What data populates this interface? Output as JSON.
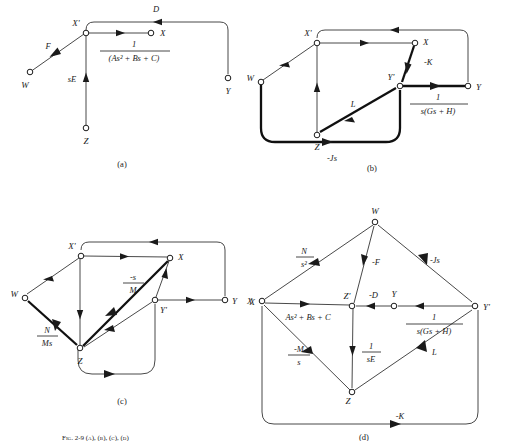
{
  "figure": {
    "caption": "Fig. 2-9 (a), (b), (c), (d)",
    "panels": [
      {
        "id": "a",
        "caption": "(a)",
        "nodes": [
          {
            "name": "W",
            "label": "W"
          },
          {
            "name": "Xp",
            "label": "X'"
          },
          {
            "name": "X",
            "label": "X"
          },
          {
            "name": "Y",
            "label": "Y"
          },
          {
            "name": "Z",
            "label": "Z"
          }
        ],
        "edges": [
          {
            "from": "W",
            "to": "Xp",
            "label": "F",
            "bold": false
          },
          {
            "from": "Z",
            "to": "Xp",
            "label": "sE",
            "bold": false
          },
          {
            "from": "Y",
            "to": "Xp",
            "label": "D",
            "bold": false
          },
          {
            "from": "Xp",
            "to": "X",
            "label": "1 / (As² + Bs + C)",
            "num": "1",
            "den": "(As²  +  Bs  +  C)",
            "bold": false
          }
        ]
      },
      {
        "id": "b",
        "caption": "(b)",
        "nodes": [
          {
            "name": "W",
            "label": "W"
          },
          {
            "name": "Xp",
            "label": "X'"
          },
          {
            "name": "X",
            "label": "X"
          },
          {
            "name": "Yp",
            "label": "Y'"
          },
          {
            "name": "Y",
            "label": "Y"
          },
          {
            "name": "Z",
            "label": "Z"
          }
        ],
        "edges": [
          {
            "from": "Xp",
            "to": "W",
            "label": "",
            "bold": false
          },
          {
            "from": "Z",
            "to": "Xp",
            "label": "",
            "bold": false
          },
          {
            "from": "Y",
            "to": "Xp",
            "label": "",
            "bold": false
          },
          {
            "from": "Xp",
            "to": "X",
            "label": "",
            "bold": false
          },
          {
            "from": "X",
            "to": "Yp",
            "label": "-K",
            "bold": true
          },
          {
            "from": "Z",
            "to": "Yp",
            "label": "L",
            "bold": true
          },
          {
            "from": "Yp",
            "to": "Y",
            "label": "1 / s(Gs + H)",
            "num": "1",
            "den": "s(Gs  +  H)",
            "bold": true
          },
          {
            "from": "W",
            "to": "Yp",
            "label": "-Js",
            "bold": true
          }
        ]
      },
      {
        "id": "c",
        "caption": "(c)",
        "nodes": [
          {
            "name": "W",
            "label": "W"
          },
          {
            "name": "Xp",
            "label": "X'"
          },
          {
            "name": "X",
            "label": "X"
          },
          {
            "name": "Yp",
            "label": "Y'"
          },
          {
            "name": "Y",
            "label": "Y"
          },
          {
            "name": "Z",
            "label": "Z"
          },
          {
            "name": "Xfar",
            "label": "X"
          }
        ],
        "edges": [
          {
            "from": "Xp",
            "to": "W",
            "label": "",
            "bold": false
          },
          {
            "from": "W",
            "to": "Z",
            "label": "N / Ms",
            "num": "N",
            "den": "Ms",
            "bold": true
          },
          {
            "from": "Z",
            "to": "Xp",
            "label": "",
            "bold": false
          },
          {
            "from": "Xp",
            "to": "X",
            "label": "",
            "bold": false
          },
          {
            "from": "X",
            "to": "Z",
            "label": "-s / M",
            "num": "-s",
            "den": "M",
            "bold": true
          },
          {
            "from": "Z",
            "to": "Yp",
            "label": "",
            "bold": false
          },
          {
            "from": "Yp",
            "to": "X",
            "label": "",
            "bold": false
          },
          {
            "from": "Yp",
            "to": "Y",
            "label": "",
            "bold": false
          },
          {
            "from": "Y",
            "to": "Xp",
            "label": "",
            "bold": false
          },
          {
            "from": "Z",
            "to": "Yp",
            "label": "",
            "bold": false
          }
        ]
      },
      {
        "id": "d",
        "caption": "(d)",
        "nodes": [
          {
            "name": "W",
            "label": "W"
          },
          {
            "name": "X",
            "label": "X"
          },
          {
            "name": "Zp",
            "label": "Z'"
          },
          {
            "name": "Y",
            "label": "Y"
          },
          {
            "name": "Yp",
            "label": "Y'"
          },
          {
            "name": "Z",
            "label": "Z"
          }
        ],
        "edges": [
          {
            "from": "W",
            "to": "X",
            "label": "N / s²",
            "num": "N",
            "den": "s²",
            "bold": false
          },
          {
            "from": "W",
            "to": "Zp",
            "label": "-F",
            "bold": false
          },
          {
            "from": "W",
            "to": "Yp",
            "label": "-Js",
            "bold": false
          },
          {
            "from": "X",
            "to": "Zp",
            "label": "As²  +  Bs  +  C",
            "bold": false
          },
          {
            "from": "Y",
            "to": "Zp",
            "label": "-D",
            "bold": false
          },
          {
            "from": "Yp",
            "to": "Y",
            "label": "1 / s(Gs + H)",
            "num": "1",
            "den": "s(Gs  +  H)",
            "bold": false
          },
          {
            "from": "Z",
            "to": "X",
            "label": "-M / s",
            "num": "-M",
            "den": "s",
            "bold": false
          },
          {
            "from": "Zp",
            "to": "Z",
            "label": "1 / sE",
            "num": "1",
            "den": "sE",
            "bold": false
          },
          {
            "from": "Z",
            "to": "Yp",
            "label": "L",
            "bold": false
          },
          {
            "from": "Z",
            "to": "Yp",
            "label": "-K",
            "bold": false
          }
        ]
      }
    ]
  }
}
